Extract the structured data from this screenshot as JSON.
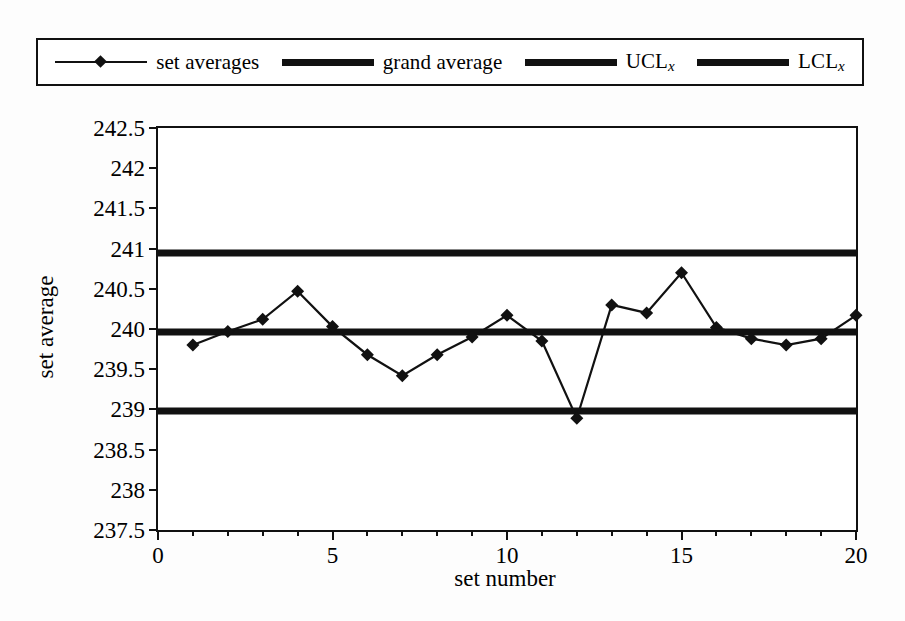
{
  "legend": {
    "entries": [
      {
        "label": "set averages",
        "style": "line-marker",
        "icon": "diamond-marker-line-icon"
      },
      {
        "label": "grand average",
        "style": "thick-line",
        "icon": "thick-line-icon"
      },
      {
        "label": "UCL",
        "sub": "x",
        "style": "thick-line",
        "icon": "thick-line-icon"
      },
      {
        "label": "LCL",
        "sub": "x",
        "style": "thick-line",
        "icon": "thick-line-icon"
      }
    ]
  },
  "axes": {
    "y_label": "set average",
    "x_label": "set number",
    "y_ticks": [
      "242.5",
      "242",
      "241.5",
      "241",
      "240.5",
      "240",
      "239.5",
      "239",
      "238.5",
      "238",
      "237.5"
    ],
    "x_ticks": [
      "0",
      "5",
      "10",
      "15",
      "20"
    ]
  },
  "colors": {
    "line": "#111111",
    "background": "#ffffff",
    "frame": "#111111"
  },
  "chart_data": {
    "type": "line",
    "title": "",
    "xlabel": "set number",
    "ylabel": "set average",
    "xlim": [
      0,
      20
    ],
    "ylim": [
      237.5,
      242.5
    ],
    "ytick_step": 0.5,
    "xtick_step": 5,
    "x_minor_step": 1,
    "grid": false,
    "legend_position": "top",
    "x": [
      1,
      2,
      3,
      4,
      5,
      6,
      7,
      8,
      9,
      10,
      11,
      12,
      13,
      14,
      15,
      16,
      17,
      18,
      19,
      20
    ],
    "series": [
      {
        "name": "set averages",
        "marker": "diamond",
        "values": [
          239.8,
          239.97,
          240.12,
          240.47,
          240.03,
          239.68,
          239.42,
          239.68,
          239.9,
          240.17,
          239.85,
          238.89,
          240.3,
          240.2,
          240.7,
          240.02,
          239.88,
          239.8,
          239.88,
          240.17
        ]
      }
    ],
    "reference_lines": [
      {
        "name": "UCL",
        "sub": "x",
        "value": 240.94,
        "style": "thick"
      },
      {
        "name": "grand average",
        "value": 239.96,
        "style": "thick"
      },
      {
        "name": "LCL",
        "sub": "x",
        "value": 238.98,
        "style": "thick"
      }
    ]
  }
}
